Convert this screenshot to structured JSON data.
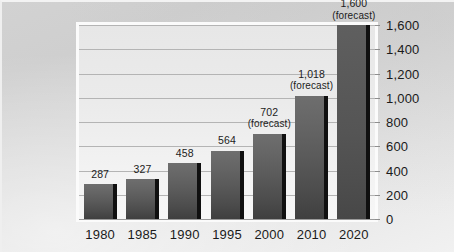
{
  "chart_data": {
    "type": "bar",
    "title": "",
    "subtitle": "",
    "xlabel": "",
    "ylabel": "",
    "categories": [
      "1980",
      "1985",
      "1990",
      "1995",
      "2000",
      "2010",
      "2020"
    ],
    "values": [
      287,
      327,
      458,
      564,
      702,
      1018,
      1600
    ],
    "point_labels": [
      "287",
      "327",
      "458",
      "564",
      "702",
      "1,018",
      "1,600"
    ],
    "point_notes": [
      "",
      "",
      "",
      "",
      "(forecast)",
      "(forecast)",
      "(forecast)"
    ],
    "forecast_flags": [
      false,
      false,
      false,
      false,
      true,
      true,
      true
    ],
    "ylim": [
      0,
      1600
    ],
    "yticks": [
      0,
      200,
      400,
      600,
      800,
      1000,
      1200,
      1400,
      1600
    ],
    "ytick_labels": [
      "0",
      "200",
      "400",
      "600",
      "800",
      "1,000",
      "1,200",
      "1,400",
      "1,600"
    ],
    "y_axis_position": "right",
    "grid": true,
    "grid_axis": "y",
    "legend": "none",
    "series": [
      {
        "name": "",
        "values": [
          287,
          327,
          458,
          564,
          702,
          1018,
          1600
        ]
      }
    ],
    "colors": {
      "bar_top": "#6e6e6e",
      "bar_bottom": "#3f3f3f",
      "bar_edge": "#101010",
      "plot_background": "#ebebeb",
      "gridline": "#b4b4b4",
      "frame": "#fbfbfb",
      "canvas_background": "#d8d8d8",
      "text": "#1a1a1a"
    }
  }
}
